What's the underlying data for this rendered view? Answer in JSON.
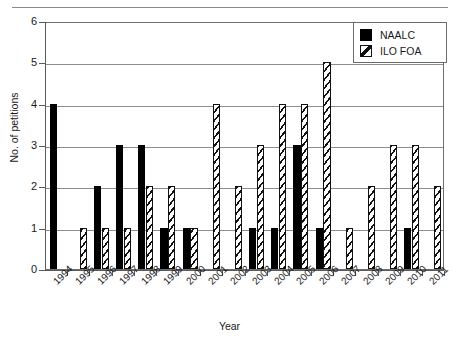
{
  "chart_data": {
    "type": "bar",
    "title": "",
    "xlabel": "Year",
    "ylabel": "No. of petitions",
    "ylim": [
      0,
      6
    ],
    "yticks": [
      0,
      1,
      2,
      3,
      4,
      5,
      6
    ],
    "grid": true,
    "legend_position": "top-right",
    "categories": [
      "1994",
      "1995",
      "1996",
      "1997",
      "1998",
      "1999",
      "2000",
      "2001",
      "2002",
      "2003",
      "2004",
      "2005",
      "2006",
      "2007",
      "2008",
      "2009",
      "2010",
      "2011"
    ],
    "series": [
      {
        "name": "NAALC",
        "style": "solid-black",
        "color": "#000000",
        "values": [
          4,
          0,
          2,
          3,
          3,
          1,
          1,
          0,
          0,
          1,
          1,
          3,
          1,
          0,
          0,
          0,
          1,
          0
        ]
      },
      {
        "name": "ILO FOA",
        "style": "diagonal-hatch",
        "color": "#111111",
        "values": [
          0,
          1,
          1,
          1,
          2,
          2,
          1,
          4,
          2,
          3,
          4,
          4,
          5,
          1,
          2,
          3,
          3,
          2
        ]
      }
    ]
  },
  "legend": {
    "items": [
      {
        "label": "NAALC"
      },
      {
        "label": "ILO FOA"
      }
    ]
  },
  "axes": {
    "y_title": "No. of petitions",
    "x_title": "Year",
    "y_tick_labels": [
      "0",
      "1",
      "2",
      "3",
      "4",
      "5",
      "6"
    ]
  }
}
